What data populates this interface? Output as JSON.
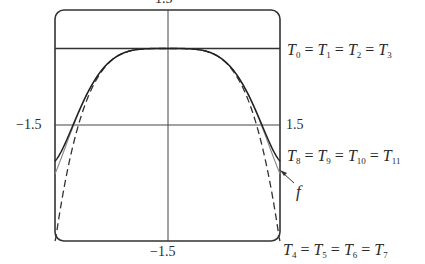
{
  "chart_data": {
    "type": "line",
    "title": "",
    "xlabel": "",
    "ylabel": "",
    "xlim": [
      -1.5,
      1.5
    ],
    "ylim": [
      -1.5,
      1.5
    ],
    "grid": false,
    "tick_labels": {
      "top": "1.5",
      "left": "−1.5",
      "right": "1.5",
      "bottom": "−1.5"
    },
    "horizontal_reference_y": 1.0,
    "series": [
      {
        "name": "T0 = T1 = T2 = T3",
        "style": "solid",
        "x": [
          -1.5,
          -1.0,
          -0.5,
          0,
          0.5,
          1.0,
          1.5
        ],
        "values": [
          1,
          1,
          1,
          1,
          1,
          1,
          1
        ]
      },
      {
        "name": "T4 = T5 = T6 = T7",
        "style": "dashed",
        "x": [
          -1.5,
          -1.25,
          -1.0,
          -0.75,
          -0.5,
          -0.25,
          0,
          0.25,
          0.5,
          0.75,
          1.0,
          1.25,
          1.5
        ],
        "values": [
          -1.53,
          -0.22,
          0.5,
          0.84,
          0.97,
          1.0,
          1.0,
          1.0,
          0.97,
          0.84,
          0.5,
          -0.22,
          -1.53
        ]
      },
      {
        "name": "T8 = T9 = T10 = T11",
        "style": "solid",
        "x": [
          -1.5,
          -1.25,
          -1.0,
          -0.75,
          -0.5,
          -0.25,
          0,
          0.25,
          0.5,
          0.75,
          1.0,
          1.25,
          1.5
        ],
        "values": [
          -0.46,
          -0.0,
          0.54,
          0.84,
          0.97,
          1.0,
          1.0,
          1.0,
          0.97,
          0.84,
          0.54,
          -0.0,
          -0.46
        ]
      },
      {
        "name": "f",
        "style": "solid-gray",
        "x": [
          -1.5,
          -1.25,
          -1.0,
          -0.75,
          -0.5,
          -0.25,
          0,
          0.25,
          0.5,
          0.75,
          1.0,
          1.25,
          1.5
        ],
        "values": [
          -0.63,
          -0.02,
          0.54,
          0.84,
          0.97,
          1.0,
          1.0,
          1.0,
          0.97,
          0.84,
          0.54,
          -0.02,
          -0.63
        ]
      }
    ],
    "annotations": [
      {
        "text": "T0 = T1 = T2 = T3",
        "points_to": "horizontal line y=1"
      },
      {
        "text": "T8 = T9 = T10 = T11",
        "points_to": "solid curve near right edge"
      },
      {
        "text": "f",
        "points_to": "gray curve at right edge (arrow)"
      },
      {
        "text": "T4 = T5 = T6 = T7",
        "points_to": "dashed curve at bottom-right corner"
      }
    ]
  },
  "labels": {
    "top_tick": "1.5",
    "left_tick": "−1.5",
    "right_tick": "1.5",
    "bottom_tick": "−1.5",
    "f": "f",
    "t0": {
      "sym": "T",
      "subs": [
        "0",
        "1",
        "2",
        "3"
      ]
    },
    "t8": {
      "sym": "T",
      "subs": [
        "8",
        "9",
        "10",
        "11"
      ]
    },
    "t4": {
      "sym": "T",
      "subs": [
        "4",
        "5",
        "6",
        "7"
      ]
    }
  }
}
